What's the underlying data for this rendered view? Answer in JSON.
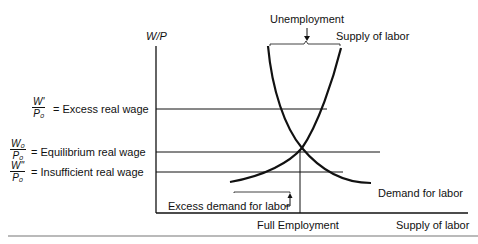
{
  "diagram": {
    "y_axis_label": "W/P",
    "x_axis_label": "Supply of labor",
    "x_marker_label": "Full Employment",
    "top_annotation": "Unemployment",
    "curves": {
      "supply": "Supply of labor",
      "demand": "Demand for labor"
    },
    "bottom_annotation": "Excess demand for labor",
    "wage_levels": [
      {
        "num": "W'",
        "den": "P₀",
        "label": "= Excess real wage"
      },
      {
        "num": "W₀",
        "den": "P₀",
        "label": "= Equilibrium real wage"
      },
      {
        "num": "W''",
        "den": "P₀",
        "label": "= Insufficient real wage"
      }
    ]
  }
}
